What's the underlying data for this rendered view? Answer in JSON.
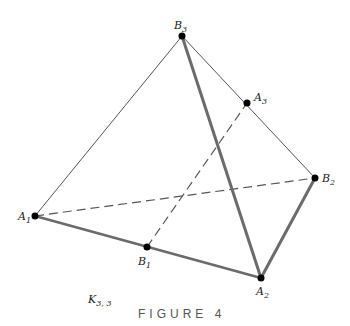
{
  "figure": {
    "caption": "FIGURE 4",
    "graph_label": {
      "main": "K",
      "sub": "3, 3"
    }
  },
  "vertices": [
    {
      "id": "B3",
      "letter": "B",
      "sub": "3",
      "x": 182,
      "y": 36
    },
    {
      "id": "A3",
      "letter": "A",
      "sub": "3",
      "x": 247,
      "y": 103
    },
    {
      "id": "B2",
      "letter": "B",
      "sub": "2",
      "x": 315,
      "y": 178
    },
    {
      "id": "A1",
      "letter": "A",
      "sub": "1",
      "x": 35,
      "y": 216
    },
    {
      "id": "B1",
      "letter": "B",
      "sub": "1",
      "x": 147,
      "y": 247
    },
    {
      "id": "A2",
      "letter": "A",
      "sub": "2",
      "x": 261,
      "y": 278
    }
  ],
  "edges": [
    {
      "from": "B3",
      "to": "A1",
      "style": "thin"
    },
    {
      "from": "B3",
      "to": "B2",
      "style": "thin"
    },
    {
      "from": "B3",
      "to": "A2",
      "style": "thick"
    },
    {
      "from": "A1",
      "to": "A2",
      "style": "thick"
    },
    {
      "from": "B2",
      "to": "A2",
      "style": "thick"
    },
    {
      "from": "A1",
      "to": "B2",
      "style": "dashed"
    },
    {
      "from": "B1",
      "to": "A3",
      "style": "dashed"
    }
  ],
  "colors": {
    "thin": "#555555",
    "thick": "#6b6b6b",
    "dashed": "#555555",
    "dot": "#000000"
  }
}
